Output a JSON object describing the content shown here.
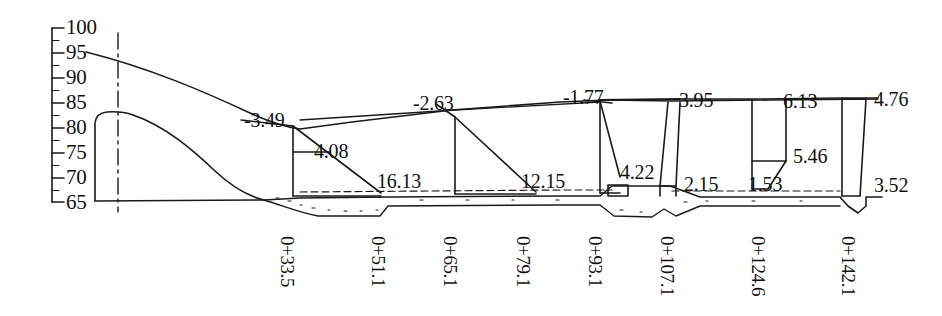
{
  "figure": {
    "type": "engineering-longitudinal-profile",
    "axis": {
      "name": "elevation-axis",
      "orientation": "vertical",
      "min": 65,
      "max": 100,
      "step": 5,
      "ticks": [
        "100",
        "95",
        "90",
        "85",
        "80",
        "75",
        "70",
        "65"
      ]
    },
    "stations": [
      {
        "label": "0+33.5",
        "x": 290
      },
      {
        "label": "0+51.1",
        "x": 381
      },
      {
        "label": "0+65.1",
        "x": 453
      },
      {
        "label": "0+79.1",
        "x": 526
      },
      {
        "label": "0+93.1",
        "x": 598
      },
      {
        "label": "0+107.1",
        "x": 670
      },
      {
        "label": "0+124.6",
        "x": 761
      },
      {
        "label": "0+142.1",
        "x": 851
      }
    ],
    "dimensions": [
      {
        "name": "slope-33-5",
        "text": "-3.49",
        "x": 244,
        "y": 110
      },
      {
        "name": "depth-33-5",
        "text": "4.08",
        "x": 314,
        "y": 141
      },
      {
        "name": "width-33-5",
        "text": "16.13",
        "x": 377,
        "y": 171
      },
      {
        "name": "slope-65-1",
        "text": "-2.63",
        "x": 413,
        "y": 93
      },
      {
        "name": "width-65-1",
        "text": "12.15",
        "x": 521,
        "y": 171
      },
      {
        "name": "slope-93-1",
        "text": "-1.77",
        "x": 563,
        "y": 87
      },
      {
        "name": "depth-93-1",
        "text": "4.22",
        "x": 620,
        "y": 162
      },
      {
        "name": "slope-107-1",
        "text": "3.95",
        "x": 679,
        "y": 90
      },
      {
        "name": "depth-107-1",
        "text": "2.15",
        "x": 684,
        "y": 174
      },
      {
        "name": "slope-124-6",
        "text": "6.13",
        "x": 783,
        "y": 91
      },
      {
        "name": "depth-124-6",
        "text": "5.46",
        "x": 793,
        "y": 146
      },
      {
        "name": "base-124-6",
        "text": "1.53",
        "x": 748,
        "y": 174
      },
      {
        "name": "slope-142-1",
        "text": "4.76",
        "x": 874,
        "y": 89
      },
      {
        "name": "depth-142-1",
        "text": "3.52",
        "x": 874,
        "y": 175
      }
    ],
    "colors": {
      "line": "#1a1a1a",
      "background": "#ffffff"
    }
  }
}
